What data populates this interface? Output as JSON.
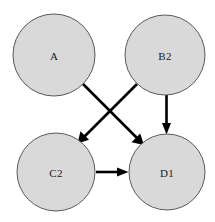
{
  "diagram": {
    "background_color": "#ffffff",
    "node_fill_color": "#d9d9d9",
    "node_stroke_color": "#595959",
    "edge_color": "#000000",
    "label_color": "#1a1a1a",
    "nodes": [
      {
        "id": "A",
        "label": "A",
        "cx": 54,
        "cy": 55,
        "r": 41
      },
      {
        "id": "B2",
        "label": "B2",
        "cx": 165,
        "cy": 55,
        "r": 40
      },
      {
        "id": "C2",
        "label": "C2",
        "cx": 56,
        "cy": 172,
        "r": 39
      },
      {
        "id": "D1",
        "label": "D1",
        "cx": 167,
        "cy": 172,
        "r": 38
      }
    ],
    "edges": [
      {
        "id": "a-d1",
        "from": "A",
        "to": "D1",
        "label": "",
        "directed": true
      },
      {
        "id": "b2-c2",
        "from": "B2",
        "to": "C2",
        "label": "",
        "directed": true
      },
      {
        "id": "b2-d1",
        "from": "B2",
        "to": "D1",
        "label": "",
        "directed": true
      },
      {
        "id": "c2-d1",
        "from": "C2",
        "to": "D1",
        "label": "",
        "directed": true
      }
    ]
  }
}
